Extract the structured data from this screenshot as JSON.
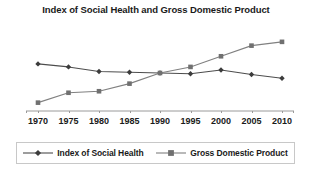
{
  "chart_data": {
    "type": "line",
    "title": "Index of Social Health and Gross Domestic Product",
    "xlabel": "",
    "ylabel": "",
    "grid": false,
    "legend_position": "bottom",
    "x": [
      1970,
      1975,
      1980,
      1985,
      1990,
      1995,
      2000,
      2005,
      2010
    ],
    "categories": [
      "1970",
      "1975",
      "1980",
      "1985",
      "1990",
      "1995",
      "2000",
      "2005",
      "2010"
    ],
    "xlim": [
      1970,
      2010
    ],
    "ylim": [
      0,
      100
    ],
    "series": [
      {
        "name": "Index of Social Health",
        "marker": "diamond",
        "color": "#4d4d4d",
        "values": [
          62,
          58,
          52,
          51,
          50,
          49,
          54,
          48,
          43
        ]
      },
      {
        "name": "Gross Domestic Product",
        "marker": "square",
        "color": "#808080",
        "values": [
          11,
          24,
          26,
          36,
          50,
          58,
          72,
          86,
          91
        ]
      }
    ]
  },
  "axis": {
    "tick_labels": [
      "1970",
      "1975",
      "1980",
      "1985",
      "1990",
      "1995",
      "2000",
      "2005",
      "2010"
    ]
  },
  "legend": {
    "entries": [
      {
        "label": "Index of Social Health",
        "marker": "diamond-marker-icon"
      },
      {
        "label": "Gross Domestic Product",
        "marker": "square-marker-icon"
      }
    ]
  }
}
